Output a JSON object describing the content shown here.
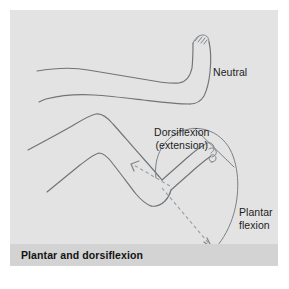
{
  "figure": {
    "caption": "Plantar and dorsiflexion",
    "panel_background": "#e3e3e3",
    "caption_background": "#d3d3d3",
    "line_color": "#6f7478",
    "dashed_arrow_color": "#9aa0a4",
    "text_color": "#1d1d1d"
  },
  "labels": {
    "neutral": "Neutral",
    "dorsiflexion_line1": "Dorsiflexion",
    "dorsiflexion_line2": "(extension)",
    "plantar_line1": "Plantar",
    "plantar_line2": "flexion"
  },
  "diagram": {
    "figures": [
      {
        "name": "neutral-leg",
        "description": "Straight leg with foot in neutral position, toes pointing up"
      },
      {
        "name": "flexed-leg",
        "description": "Bent-knee leg showing ankle range of motion"
      }
    ],
    "annotations": [
      {
        "name": "dorsiflexion-arrow",
        "direction": "up-left",
        "style": "dashed"
      },
      {
        "name": "plantar-flexion-arrow",
        "direction": "down-right",
        "style": "dashed"
      },
      {
        "name": "range-of-motion-arc",
        "style": "solid"
      },
      {
        "name": "reference-axis-line",
        "style": "solid"
      }
    ]
  }
}
